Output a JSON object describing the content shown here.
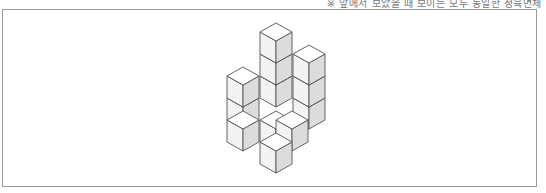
{
  "caption": "※ 앞에서 보았을 때 보이는 모두 동일한 정육면체",
  "figure": {
    "colors": {
      "top": "#ffffff",
      "left": "#f3f3f3",
      "right": "#dcdcdc",
      "stroke": "#555555",
      "frame": "#9a9a9a"
    },
    "cubes": [
      {
        "x": 276,
        "y": 67
      },
      {
        "x": 276,
        "y": 45
      },
      {
        "x": 276,
        "y": 23
      },
      {
        "x": 309,
        "y": 89
      },
      {
        "x": 309,
        "y": 67
      },
      {
        "x": 309,
        "y": 45
      },
      {
        "x": 243,
        "y": 89
      },
      {
        "x": 243,
        "y": 67
      },
      {
        "x": 276,
        "y": 111
      },
      {
        "x": 292,
        "y": 111
      },
      {
        "x": 243,
        "y": 111
      },
      {
        "x": 276,
        "y": 133
      }
    ]
  }
}
